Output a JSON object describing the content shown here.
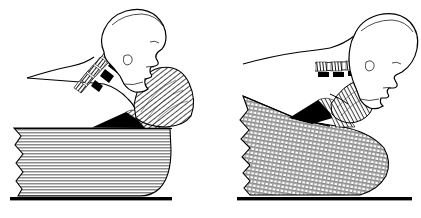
{
  "figure": {
    "type": "line-drawing",
    "width": 421,
    "height": 218,
    "background_color": "#ffffff",
    "ink_color": "#000000",
    "fill_gray": "#bdbdbd",
    "panel_count": 2,
    "caption": "",
    "title": "",
    "labels": [],
    "visible_text": []
  },
  "panels": [
    {
      "id": "left",
      "name": "thick-pillow-neck-flexed",
      "description": "Side view of head, neck and shoulder resting on a tall rectangular pillow; cervical spine is flexed forward.",
      "pillow": {
        "name": "thick-pillow",
        "shape": "tall-rectangle-rounded-right",
        "hatch_direction": "horizontal",
        "top_y": 128,
        "bottom_y": 196,
        "left_x": 14,
        "right_x": 172
      },
      "baseline": {
        "name": "mattress-baseline",
        "x1": 10,
        "x2": 172,
        "y": 199
      },
      "anatomy": {
        "head": "profile facing right, upright",
        "spine": "cervical vertebrae curved, discs dark",
        "shoulder": "rounded trapezius mass, fine radial hatching",
        "vertebra_count": 6
      }
    },
    {
      "id": "right",
      "name": "wedge-pillow-neck-extended",
      "description": "Side view of head tilted back on a collapsed wedge-shaped pillow; cervical spine is straightened and hyperextended.",
      "pillow": {
        "name": "wedge-pillow",
        "shape": "slanted-wedge-rounded-right",
        "hatch_direction": "diagonal-crosshatch",
        "top_y": 95,
        "bottom_y": 196,
        "left_x": 237,
        "right_x": 390
      },
      "baseline": {
        "name": "mattress-baseline",
        "x1": 237,
        "x2": 412,
        "y": 199
      },
      "anatomy": {
        "head": "profile facing right, tilted back / hyperextended",
        "spine": "cervical vertebrae flattened horizontal, discs dark",
        "shoulder": "compressed trapezius mass, fine radial hatching",
        "vertebra_count": 6
      }
    }
  ]
}
